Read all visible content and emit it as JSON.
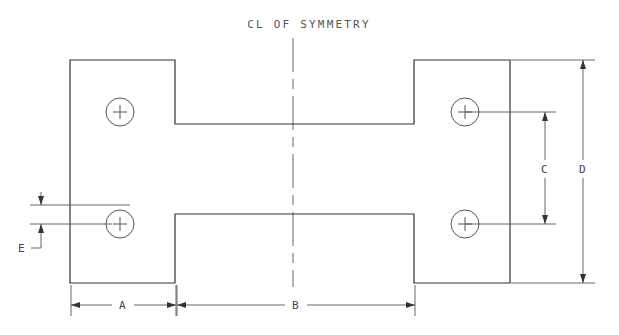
{
  "drawing": {
    "title_note": "CL OF SYMMETRY",
    "colors": {
      "outline": "#333333",
      "dimension": "#555555",
      "centerline": "#666666",
      "background": "#ffffff",
      "text": "#444444"
    },
    "dimensions": [
      {
        "id": "A",
        "label": "A",
        "orientation": "horizontal",
        "description": "left flange width"
      },
      {
        "id": "B",
        "label": "B",
        "orientation": "horizontal",
        "description": "center web length"
      },
      {
        "id": "C",
        "label": "C",
        "orientation": "vertical",
        "description": "hole center to hole center spacing"
      },
      {
        "id": "D",
        "label": "D",
        "orientation": "vertical",
        "description": "overall height"
      },
      {
        "id": "E",
        "label": "E",
        "orientation": "vertical",
        "description": "web edge to hole center offset"
      }
    ],
    "holes": [
      {
        "id": "hole-top-left",
        "cx": 120,
        "cy": 112
      },
      {
        "id": "hole-bottom-left",
        "cx": 120,
        "cy": 224
      },
      {
        "id": "hole-top-right",
        "cx": 465,
        "cy": 112
      },
      {
        "id": "hole-bottom-right",
        "cx": 465,
        "cy": 224
      }
    ],
    "geometry": {
      "outline_points": "70,60 175,60 175,124 414,124 414,60 510,60 510,283 414,283 414,214 175,214 175,283 70,283 70,60",
      "left_edge_x": 70,
      "right_edge_x": 510,
      "top_edge_y": 60,
      "bottom_edge_y": 283,
      "step_left_x": 175,
      "step_right_x": 414,
      "web_top_y": 124,
      "web_bottom_y": 214
    },
    "centerline": {
      "x": 293,
      "y_top": 38,
      "y_bottom": 287
    }
  }
}
